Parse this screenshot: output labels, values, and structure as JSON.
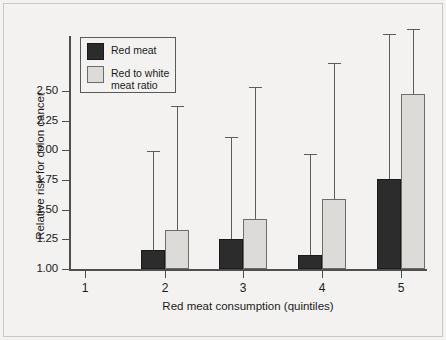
{
  "chart_data": {
    "type": "bar",
    "title": "",
    "xlabel": "Red meat consumption (quintiles)",
    "ylabel": "Relative risk for colon cancer",
    "categories": [
      "1",
      "2",
      "3",
      "4",
      "5"
    ],
    "ylim": [
      1.0,
      2.62
    ],
    "yticks": [
      "1.00",
      "1.25",
      "1.50",
      "1.75",
      "2.00",
      "2.25",
      "2.50"
    ],
    "ytick_values": [
      1.0,
      1.25,
      1.5,
      1.75,
      2.0,
      2.25,
      2.5
    ],
    "grid": false,
    "legend_position": "top-left",
    "series": [
      {
        "name": "Red meat",
        "color": "#2c2c2c",
        "values": [
          1.0,
          1.16,
          1.25,
          1.12,
          1.76
        ],
        "error_upper": [
          null,
          1.99,
          2.11,
          1.97,
          2.98
        ]
      },
      {
        "name": "Red to white meat ratio",
        "color": "#dcdbd7",
        "values": [
          1.0,
          1.33,
          1.42,
          1.59,
          2.47
        ],
        "error_upper": [
          null,
          2.37,
          2.53,
          2.73,
          3.02
        ]
      }
    ]
  },
  "legend": {
    "entries": [
      {
        "label": "Red meat",
        "swatch": "dark-swatch"
      },
      {
        "label": "Red to white\nmeat ratio",
        "swatch": "light-swatch"
      }
    ]
  },
  "axes": {
    "y_labels": [
      "2.50",
      "2.25",
      "2.00",
      "1.75",
      "1.50",
      "1.25",
      "1.00"
    ],
    "x_labels": [
      "1",
      "2",
      "3",
      "4",
      "5"
    ],
    "x_title": "Red meat consumption (quintiles)",
    "y_title": "Relative risk for colon cancer"
  }
}
